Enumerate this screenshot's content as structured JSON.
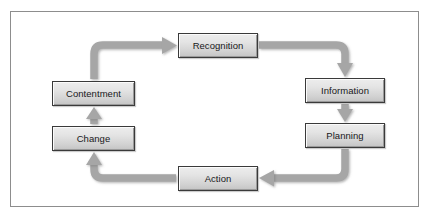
{
  "diagram": {
    "type": "cycle-flow-diagram",
    "title": "",
    "frame": {
      "border_color": "#8d8d8d",
      "background_color": "#ffffff"
    },
    "style": {
      "node_fill_top": "#ededed",
      "node_fill_bottom": "#c4c4c4",
      "node_border_color": "#3a3a3a",
      "arrow_color": "#a6a6a6",
      "arrow_shadow_color": "#8f8f8f",
      "label_color": "#18181a"
    },
    "nodes": [
      {
        "id": "recognition",
        "label": "Recognition"
      },
      {
        "id": "information",
        "label": "Information"
      },
      {
        "id": "planning",
        "label": "Planning"
      },
      {
        "id": "action",
        "label": "Action"
      },
      {
        "id": "change",
        "label": "Change"
      },
      {
        "id": "contentment",
        "label": "Contentment"
      }
    ],
    "edges": [
      {
        "from": "recognition",
        "to": "information",
        "direction": "right-then-down"
      },
      {
        "from": "information",
        "to": "planning",
        "direction": "down"
      },
      {
        "from": "planning",
        "to": "action",
        "direction": "down-then-left"
      },
      {
        "from": "action",
        "to": "change",
        "direction": "left-then-up"
      },
      {
        "from": "change",
        "to": "contentment",
        "direction": "up"
      },
      {
        "from": "contentment",
        "to": "recognition",
        "direction": "up-then-right"
      }
    ]
  }
}
